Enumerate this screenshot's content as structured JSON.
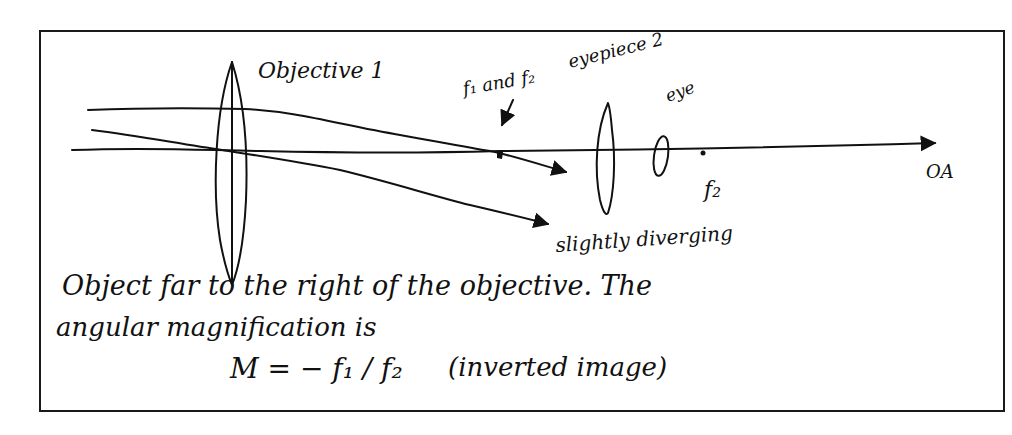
{
  "diagram": {
    "labels": {
      "objective": "Objective 1",
      "focal_note": "f₁ and f₂",
      "eyepiece": "eyepiece 2",
      "eye": "eye",
      "f2": "f₂",
      "optical_axis": "OA",
      "diverging": "slightly diverging"
    },
    "text_lines": [
      "Object far to the right of the objective.  The",
      "angular magnification is"
    ],
    "formula": {
      "lhs": "M = − f₁ / f₂",
      "note": "(inverted image)"
    }
  }
}
